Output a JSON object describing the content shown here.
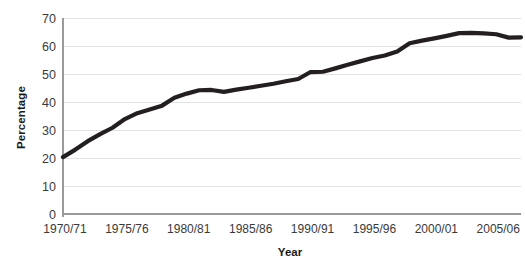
{
  "chart_data": {
    "type": "line",
    "title": "",
    "xlabel": "Year",
    "ylabel": "Percentage",
    "grid": true,
    "legend": "none",
    "ylim": [
      0,
      70
    ],
    "ytick_labels": [
      "70",
      "60",
      "50",
      "40",
      "30",
      "20",
      "10",
      "0"
    ],
    "ytick_values": [
      70,
      60,
      50,
      40,
      30,
      20,
      10,
      0
    ],
    "xtick_labels": [
      "1970/71",
      "1975/76",
      "1980/81",
      "1985/86",
      "1990/91",
      "1995/96",
      "2000/01",
      "2005/06"
    ],
    "xtick_values": [
      1970,
      1975,
      1980,
      1985,
      1990,
      1995,
      2000,
      2005
    ],
    "x": [
      1970,
      1971,
      1972,
      1973,
      1974,
      1975,
      1976,
      1977,
      1978,
      1979,
      1980,
      1981,
      1982,
      1983,
      1984,
      1985,
      1986,
      1987,
      1988,
      1989,
      1990,
      1991,
      1992,
      1993,
      1994,
      1995,
      1996,
      1997,
      1998,
      1999,
      2000,
      2001,
      2002,
      2003,
      2004,
      2005,
      2006,
      2007
    ],
    "x_categories": [
      "1970/71",
      "1971/72",
      "1972/73",
      "1973/74",
      "1974/75",
      "1975/76",
      "1976/77",
      "1977/78",
      "1978/79",
      "1979/80",
      "1980/81",
      "1981/82",
      "1982/83",
      "1983/84",
      "1984/85",
      "1985/86",
      "1986/87",
      "1987/88",
      "1988/89",
      "1989/90",
      "1990/91",
      "1991/92",
      "1992/93",
      "1993/94",
      "1994/95",
      "1995/96",
      "1996/97",
      "1997/98",
      "1998/99",
      "1999/00",
      "2000/01",
      "2001/02",
      "2002/03",
      "2003/04",
      "2004/05",
      "2005/06",
      "2006/07",
      "2007/08"
    ],
    "values": [
      20.3,
      23.0,
      26.0,
      28.5,
      30.8,
      33.9,
      36.0,
      37.3,
      38.7,
      41.5,
      43.0,
      44.2,
      44.3,
      43.6,
      44.4,
      45.1,
      45.8,
      46.5,
      47.4,
      48.2,
      50.7,
      50.8,
      52.0,
      53.3,
      54.5,
      55.7,
      56.6,
      58.0,
      61.0,
      61.9,
      62.7,
      63.6,
      64.6,
      64.7,
      64.5,
      64.2,
      63.0,
      63.1
    ],
    "series": [
      {
        "name": "Percentage",
        "color": "#231f20",
        "values": [
          20.3,
          23.0,
          26.0,
          28.5,
          30.8,
          33.9,
          36.0,
          37.3,
          38.7,
          41.5,
          43.0,
          44.2,
          44.3,
          43.6,
          44.4,
          45.1,
          45.8,
          46.5,
          47.4,
          48.2,
          50.7,
          50.8,
          52.0,
          53.3,
          54.5,
          55.7,
          56.6,
          58.0,
          61.0,
          61.9,
          62.7,
          63.6,
          64.6,
          64.7,
          64.5,
          64.2,
          63.0,
          63.1
        ]
      }
    ]
  },
  "axes": {
    "x_title": "Year",
    "y_title": "Percentage"
  },
  "colors": {
    "line": "#231f20",
    "grid": "#e2e2e2",
    "axis": "#9a9a9a",
    "tick_text": "#3a3a3a",
    "title_text": "#1a1a1a",
    "background": "#ffffff"
  }
}
